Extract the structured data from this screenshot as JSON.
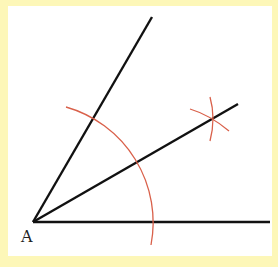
{
  "diagram": {
    "vertex_label": "A",
    "colors": {
      "background_border": "#fdf7b8",
      "panel": "#ffffff",
      "rays": "#111111",
      "arcs": "#d9604a"
    },
    "vertex": {
      "x": 33,
      "y": 222
    },
    "rays": [
      {
        "name": "upper-ray",
        "end": {
          "x": 152,
          "y": 17
        }
      },
      {
        "name": "bisector-ray",
        "end": {
          "x": 238,
          "y": 104
        }
      },
      {
        "name": "base-ray",
        "end": {
          "x": 270,
          "y": 222
        }
      }
    ],
    "arcs": [
      {
        "name": "main-arc-centered-at-A",
        "radius": 120
      },
      {
        "name": "intersection-arc-1"
      },
      {
        "name": "intersection-arc-2"
      }
    ]
  }
}
